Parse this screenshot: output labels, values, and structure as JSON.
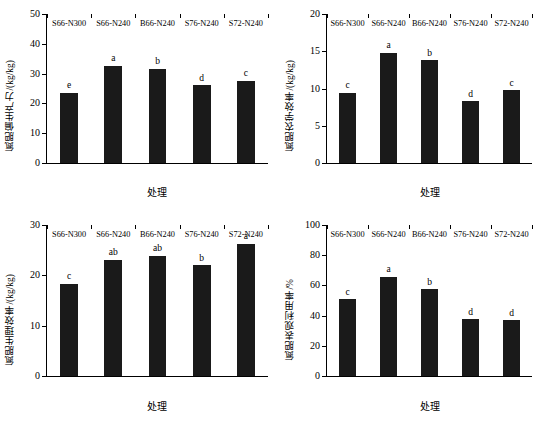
{
  "figure": {
    "panel_count": 4
  },
  "chart_data": [
    {
      "type": "bar",
      "title": "",
      "xlabel": "处理",
      "ylabel": "氮肥偏生产力/(kg/kg)",
      "categories": [
        "S66-N300",
        "S66-N240",
        "B66-N240",
        "S76-N240",
        "S72-N240"
      ],
      "values": [
        23.5,
        32.6,
        31.7,
        26.1,
        27.6
      ],
      "annotations": [
        "e",
        "a",
        "b",
        "d",
        "c"
      ],
      "ylim": [
        0,
        50
      ],
      "yticks": [
        0,
        10,
        20,
        30,
        40,
        50
      ],
      "grid": false,
      "legend": "none",
      "bar_color": "#1a1a1a"
    },
    {
      "type": "bar",
      "title": "",
      "xlabel": "处理",
      "ylabel": "氮肥农学效率/(kg/kg)",
      "categories": [
        "S66-N300",
        "S66-N240",
        "B66-N240",
        "S76-N240",
        "S72-N240"
      ],
      "values": [
        9.4,
        14.8,
        13.8,
        8.3,
        9.8
      ],
      "annotations": [
        "c",
        "a",
        "b",
        "d",
        "c"
      ],
      "ylim": [
        0,
        20
      ],
      "yticks": [
        0,
        5,
        10,
        15,
        20
      ],
      "grid": false,
      "legend": "none",
      "bar_color": "#1a1a1a"
    },
    {
      "type": "bar",
      "title": "",
      "xlabel": "处理",
      "ylabel": "氮肥生理效率/(kg/kg)",
      "categories": [
        "S66-N300",
        "S66-N240",
        "B66-N240",
        "S76-N240",
        "S72-N240"
      ],
      "values": [
        18.3,
        23.1,
        23.9,
        22.0,
        26.3
      ],
      "annotations": [
        "c",
        "ab",
        "ab",
        "b",
        "a"
      ],
      "ylim": [
        0,
        30
      ],
      "yticks": [
        0,
        10,
        20,
        30
      ],
      "grid": false,
      "legend": "none",
      "bar_color": "#1a1a1a"
    },
    {
      "type": "bar",
      "title": "",
      "xlabel": "处理",
      "ylabel": "氮肥表观利用率/%",
      "categories": [
        "S66-N300",
        "S66-N240",
        "B66-N240",
        "S76-N240",
        "S72-N240"
      ],
      "values": [
        51.0,
        65.6,
        57.6,
        37.6,
        37.0
      ],
      "annotations": [
        "c",
        "a",
        "b",
        "d",
        "d"
      ],
      "ylim": [
        0,
        100
      ],
      "yticks": [
        0,
        20,
        40,
        60,
        80,
        100
      ],
      "grid": false,
      "legend": "none",
      "bar_color": "#1a1a1a"
    }
  ]
}
